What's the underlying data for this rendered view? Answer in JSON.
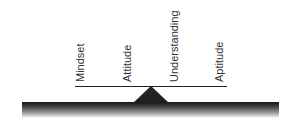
{
  "diagram": {
    "type": "seesaw-balance",
    "labels": [
      {
        "text": "Mindset"
      },
      {
        "text": "Attitude"
      },
      {
        "text": "Understanding"
      },
      {
        "text": "Aptitude"
      }
    ],
    "colors": {
      "beam": "#222222",
      "fulcrum": "#222222",
      "ground_top": "#151515",
      "text": "#333333"
    }
  }
}
